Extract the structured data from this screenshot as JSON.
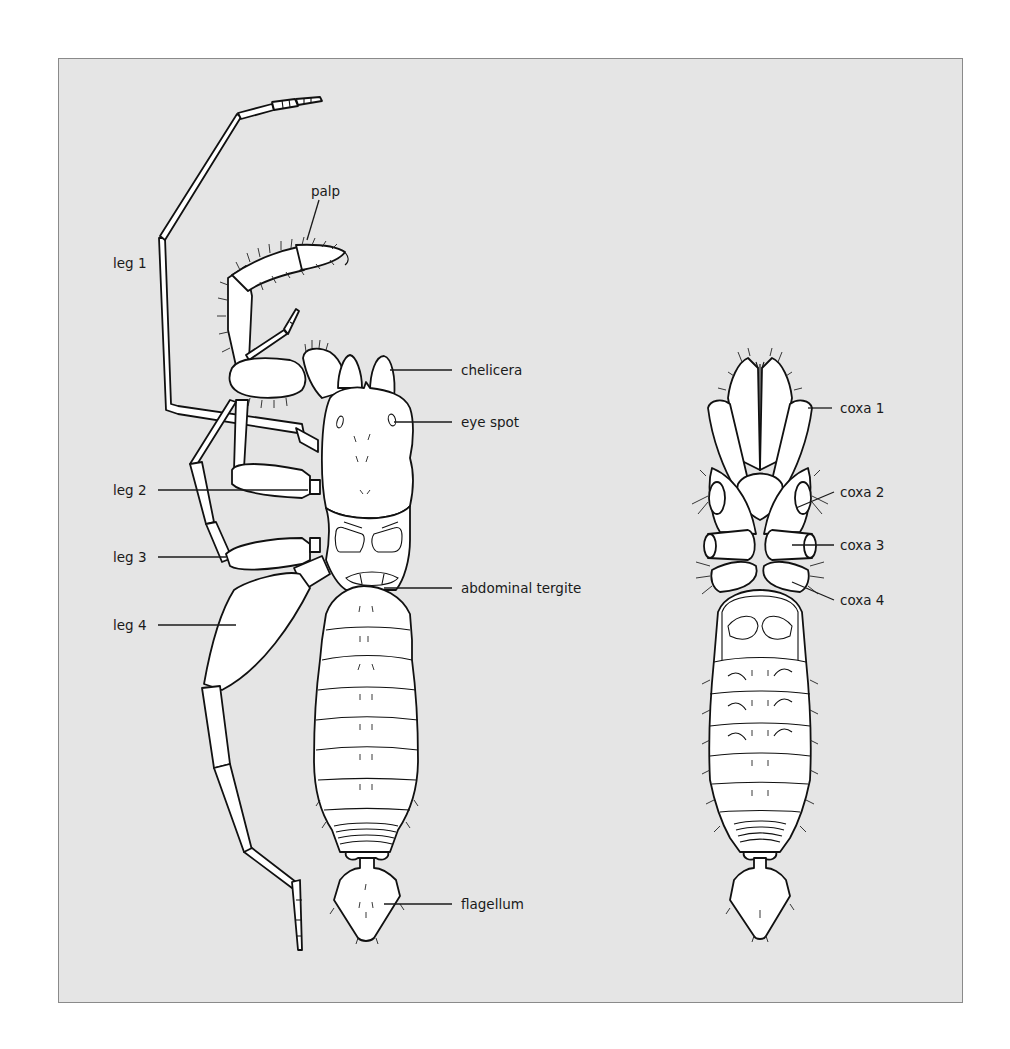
{
  "figure": {
    "background_color": "#e5e5e5",
    "border_color": "#8a8a8a",
    "line_color": "#111111",
    "views": [
      {
        "id": "dorsal-view",
        "description": "dorsal view, legs shown on left side"
      },
      {
        "id": "ventral-view",
        "description": "ventral view"
      }
    ],
    "labels": {
      "palp": "palp",
      "leg1": "leg 1",
      "leg2": "leg 2",
      "leg3": "leg 3",
      "leg4": "leg 4",
      "chelicera": "chelicera",
      "eye_spot": "eye spot",
      "abdominal_tergite": "abdominal tergite",
      "flagellum": "flagellum",
      "coxa1": "coxa 1",
      "coxa2": "coxa 2",
      "coxa3": "coxa 3",
      "coxa4": "coxa 4"
    }
  }
}
